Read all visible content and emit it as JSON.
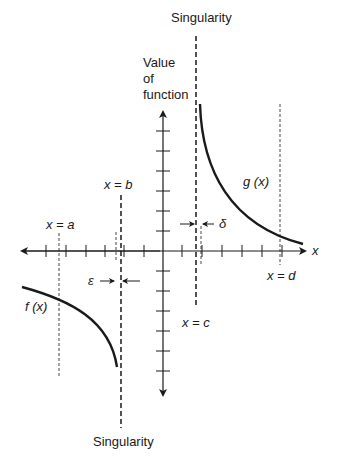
{
  "labels": {
    "singularity_top": "Singularity",
    "singularity_bottom": "Singularity",
    "value_of_function_1": "Value",
    "value_of_function_2": "of",
    "value_of_function_3": "function",
    "x_eq_a": "x = a",
    "x_eq_b": "x = b",
    "x_eq_c": "x = c",
    "x_eq_d": "x = d",
    "x_axis": "x",
    "f_x": "f (x)",
    "g_x": "g (x)",
    "epsilon": "ε",
    "delta": "δ"
  },
  "colors": {
    "ink": "#1a1a1a",
    "background": "#ffffff"
  }
}
